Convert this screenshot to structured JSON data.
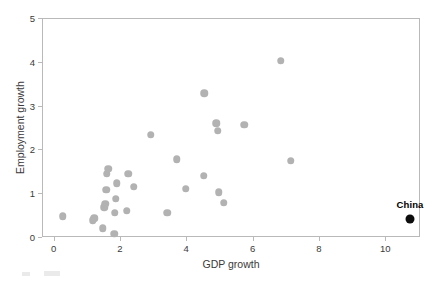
{
  "figure": {
    "background_color": "#ffffff",
    "frame_color": "#b9b9b9"
  },
  "axes": {
    "x_title": "GDP growth",
    "y_title": "Employment growth",
    "x_ticks": [
      "0",
      "2",
      "4",
      "6",
      "8",
      "10"
    ],
    "y_ticks": [
      "0",
      "1",
      "2",
      "3",
      "4",
      "5"
    ]
  },
  "annotation": {
    "china_label": "China"
  },
  "chart_data": {
    "type": "scatter",
    "title": "",
    "xlabel": "GDP growth",
    "ylabel": "Employment growth",
    "xlim": [
      -0.35,
      11.05
    ],
    "ylim": [
      0,
      5
    ],
    "xticks": [
      0,
      2,
      4,
      6,
      8,
      10
    ],
    "yticks": [
      0,
      1,
      2,
      3,
      4,
      5
    ],
    "grid": false,
    "legend": null,
    "series": [
      {
        "name": "Countries",
        "color": "#b2b2b2",
        "marker": "circle",
        "points": [
          {
            "x": 0.25,
            "y": 0.5
          },
          {
            "x": 1.15,
            "y": 0.4
          },
          {
            "x": 1.2,
            "y": 0.45
          },
          {
            "x": 1.45,
            "y": 0.22
          },
          {
            "x": 1.5,
            "y": 0.7
          },
          {
            "x": 1.52,
            "y": 0.78
          },
          {
            "x": 1.55,
            "y": 1.1
          },
          {
            "x": 1.58,
            "y": 1.47
          },
          {
            "x": 1.62,
            "y": 1.58
          },
          {
            "x": 1.8,
            "y": 0.1
          },
          {
            "x": 1.82,
            "y": 0.58
          },
          {
            "x": 1.85,
            "y": 0.9
          },
          {
            "x": 1.88,
            "y": 1.25
          },
          {
            "x": 2.18,
            "y": 0.62
          },
          {
            "x": 2.22,
            "y": 1.47
          },
          {
            "x": 2.38,
            "y": 1.17
          },
          {
            "x": 2.9,
            "y": 2.36
          },
          {
            "x": 3.4,
            "y": 0.58
          },
          {
            "x": 3.68,
            "y": 1.8
          },
          {
            "x": 3.95,
            "y": 1.13
          },
          {
            "x": 4.5,
            "y": 1.42
          },
          {
            "x": 4.52,
            "y": 3.3
          },
          {
            "x": 4.88,
            "y": 2.62
          },
          {
            "x": 4.92,
            "y": 2.45
          },
          {
            "x": 4.95,
            "y": 1.05
          },
          {
            "x": 5.1,
            "y": 0.8
          },
          {
            "x": 5.72,
            "y": 2.58
          },
          {
            "x": 6.82,
            "y": 4.05
          },
          {
            "x": 7.12,
            "y": 1.76
          }
        ]
      },
      {
        "name": "China",
        "color": "#0d0d0d",
        "marker": "circle",
        "labelled": true,
        "points": [
          {
            "x": 10.72,
            "y": 0.43,
            "label": "China"
          }
        ]
      }
    ]
  }
}
